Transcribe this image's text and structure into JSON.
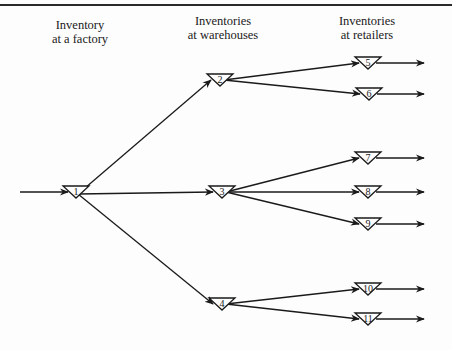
{
  "diagram": {
    "type": "multi-echelon inventory network",
    "stages": [
      {
        "id": "factory",
        "line1": "Inventory",
        "line2": "at a factory",
        "x": 80
      },
      {
        "id": "warehouses",
        "line1": "Inventories",
        "line2": "at warehouses",
        "x": 223
      },
      {
        "id": "retailers",
        "line1": "Inventories",
        "line2": "at retailers",
        "x": 367
      }
    ],
    "nodes": [
      {
        "id": "1",
        "label": "1",
        "stage": "factory",
        "cx": 76,
        "top": 186
      },
      {
        "id": "2",
        "label": "2",
        "stage": "warehouses",
        "cx": 220,
        "top": 74
      },
      {
        "id": "3",
        "label": "3",
        "stage": "warehouses",
        "cx": 222,
        "top": 186
      },
      {
        "id": "4",
        "label": "4",
        "stage": "warehouses",
        "cx": 222,
        "top": 298
      },
      {
        "id": "5",
        "label": "5",
        "stage": "retailers",
        "cx": 368,
        "top": 57
      },
      {
        "id": "6",
        "label": "6",
        "stage": "retailers",
        "cx": 369,
        "top": 88
      },
      {
        "id": "7",
        "label": "7",
        "stage": "retailers",
        "cx": 368,
        "top": 152
      },
      {
        "id": "8",
        "label": "8",
        "stage": "retailers",
        "cx": 368,
        "top": 186
      },
      {
        "id": "9",
        "label": "9",
        "stage": "retailers",
        "cx": 368,
        "top": 218
      },
      {
        "id": "10",
        "label": "10",
        "stage": "retailers",
        "cx": 368,
        "top": 283
      },
      {
        "id": "11",
        "label": "11",
        "stage": "retailers",
        "cx": 368,
        "top": 313
      }
    ],
    "edges": [
      {
        "from": "input",
        "to": "1"
      },
      {
        "from": "1",
        "to": "2"
      },
      {
        "from": "1",
        "to": "3"
      },
      {
        "from": "1",
        "to": "4"
      },
      {
        "from": "2",
        "to": "5"
      },
      {
        "from": "2",
        "to": "6"
      },
      {
        "from": "3",
        "to": "7"
      },
      {
        "from": "3",
        "to": "8"
      },
      {
        "from": "3",
        "to": "9"
      },
      {
        "from": "4",
        "to": "10"
      },
      {
        "from": "4",
        "to": "11"
      },
      {
        "from": "5",
        "to": "output"
      },
      {
        "from": "6",
        "to": "output"
      },
      {
        "from": "7",
        "to": "output"
      },
      {
        "from": "8",
        "to": "output"
      },
      {
        "from": "9",
        "to": "output"
      },
      {
        "from": "10",
        "to": "output"
      },
      {
        "from": "11",
        "to": "output"
      }
    ],
    "colors": {
      "line": "#1a1a1a",
      "background": "#fdfdfd"
    }
  }
}
